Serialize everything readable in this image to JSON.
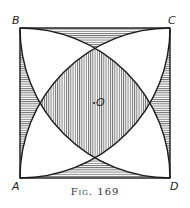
{
  "figure": {
    "caption": "Fig. 169",
    "labels": {
      "A": "A",
      "B": "B",
      "C": "C",
      "D": "D",
      "O": "O"
    },
    "colors": {
      "stroke": "#1a1a1a",
      "hatch": "#555555",
      "background": "#ffffff"
    }
  }
}
